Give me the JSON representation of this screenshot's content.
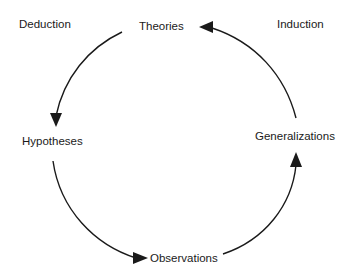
{
  "diagram": {
    "corner_labels": {
      "left": "Deduction",
      "right": "Induction"
    },
    "nodes": {
      "top": "Theories",
      "left": "Hypotheses",
      "right": "Generalizations",
      "bottom": "Observations"
    },
    "edges": [
      {
        "from": "Theories",
        "to": "Hypotheses"
      },
      {
        "from": "Hypotheses",
        "to": "Observations"
      },
      {
        "from": "Observations",
        "to": "Generalizations"
      },
      {
        "from": "Generalizations",
        "to": "Theories"
      }
    ],
    "colors": {
      "line": "#1a1a1a",
      "background": "#ffffff"
    }
  }
}
